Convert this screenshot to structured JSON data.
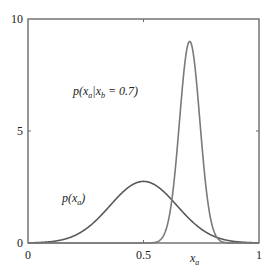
{
  "chart_data": {
    "type": "line",
    "title": "",
    "xlabel": "x_a",
    "ylabel": "",
    "xlim": [
      0,
      1
    ],
    "ylim": [
      0,
      10
    ],
    "grid": false,
    "legend": "none (inline annotations)",
    "x_ticks": [
      "0",
      "0.5",
      "1"
    ],
    "y_ticks": [
      "0",
      "5",
      "10"
    ],
    "series": [
      {
        "name": "p(x_a)",
        "distribution": "gaussian",
        "mean": 0.5,
        "std": 0.145,
        "peak": 2.75,
        "color": "#5a5a5a",
        "x": [
          0.0,
          0.1,
          0.2,
          0.3,
          0.4,
          0.5,
          0.6,
          0.7,
          0.8,
          0.9,
          1.0
        ],
        "values": [
          0.01,
          0.06,
          0.32,
          1.06,
          2.07,
          2.75,
          2.07,
          1.06,
          0.32,
          0.06,
          0.01
        ]
      },
      {
        "name": "p(x_a|x_b = 0.7)",
        "distribution": "gaussian",
        "mean": 0.7,
        "std": 0.044,
        "peak": 9.0,
        "color": "#7a7a7a",
        "x": [
          0.55,
          0.6,
          0.65,
          0.7,
          0.75,
          0.8,
          0.85
        ],
        "values": [
          0.01,
          0.69,
          4.6,
          9.0,
          4.6,
          0.69,
          0.01
        ]
      }
    ],
    "annotations": [
      {
        "text": "p(x_a|x_b = 0.7)",
        "x": 0.2,
        "y": 7.2
      },
      {
        "text": "p(x_a)",
        "x": 0.1,
        "y": 2.1
      }
    ]
  },
  "labels": {
    "x_axis": "x",
    "x_axis_sub": "a",
    "cond_label_main": "p(x",
    "cond_label_sub1": "a",
    "cond_label_mid": "|x",
    "cond_label_sub2": "b",
    "cond_label_tail": " = 0.7)",
    "marg_label_main": "p(x",
    "marg_label_sub": "a",
    "marg_label_tail": ")"
  }
}
